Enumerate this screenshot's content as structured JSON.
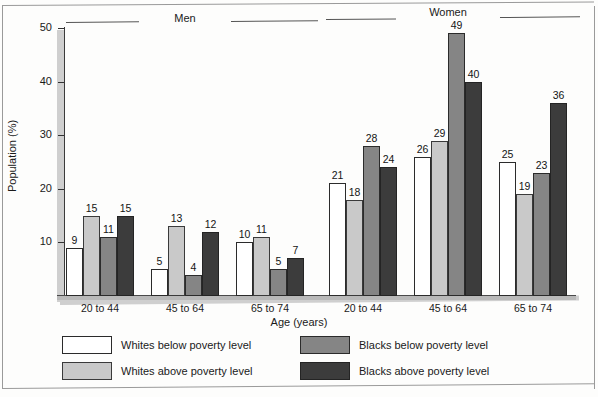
{
  "chart_data": {
    "type": "bar",
    "title": "",
    "xlabel": "Age (years)",
    "ylabel": "Population (%)",
    "ylim": [
      0,
      50
    ],
    "yticks": [
      10,
      20,
      30,
      40,
      50
    ],
    "grid": false,
    "legend_position": "bottom",
    "group_headers": [
      "Men",
      "Women"
    ],
    "categories": [
      "Men 20 to 44",
      "Men 45 to 64",
      "Men 65 to 74",
      "Women 20 to 44",
      "Women 45 to 64",
      "Women 65 to 74"
    ],
    "age_labels": [
      "20 to 44",
      "45 to 64",
      "65 to 74",
      "20 to 44",
      "45 to 64",
      "65 to 74"
    ],
    "series": [
      {
        "name": "Whites below poverty level",
        "color": "#ffffff",
        "values": [
          9,
          5,
          10,
          21,
          26,
          25
        ]
      },
      {
        "name": "Whites above poverty level",
        "color": "#c9c9c9",
        "values": [
          15,
          13,
          11,
          18,
          29,
          19
        ]
      },
      {
        "name": "Blacks below poverty level",
        "color": "#858585",
        "values": [
          11,
          4,
          5,
          28,
          49,
          23
        ]
      },
      {
        "name": "Blacks above poverty level",
        "color": "#3c3c3c",
        "values": [
          15,
          12,
          7,
          24,
          40,
          36
        ]
      }
    ]
  },
  "axis": {
    "ylabel": "Population (%)",
    "xlabel": "Age (years)",
    "ytick_labels": [
      "10",
      "20",
      "30",
      "40",
      "50"
    ]
  },
  "headers": {
    "men": "Men",
    "women": "Women"
  },
  "legend": {
    "items": [
      {
        "label": "Whites below poverty level",
        "swatch": "s0"
      },
      {
        "label": "Whites above poverty level",
        "swatch": "s1"
      },
      {
        "label": "Blacks below poverty level",
        "swatch": "s2"
      },
      {
        "label": "Blacks above poverty level",
        "swatch": "s3"
      }
    ]
  }
}
